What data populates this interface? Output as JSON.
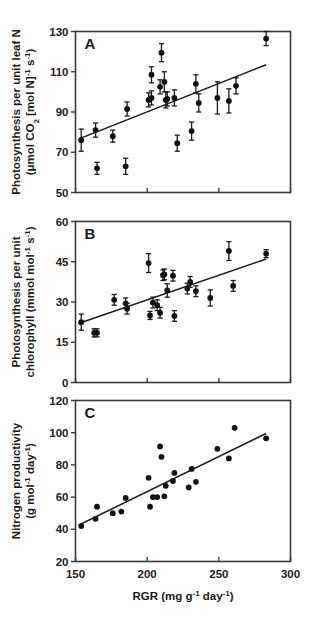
{
  "figure": {
    "xaxis": {
      "label_main": "RGR (mg g",
      "label_sup1": "-1",
      "label_mid": " day",
      "label_sup2": "-1",
      "label_end": ")",
      "min": 150,
      "max": 300,
      "ticks": [
        150,
        200,
        250,
        300
      ]
    }
  },
  "chart_data": [
    {
      "type": "scatter",
      "panel": "A",
      "title": "Photosynthesis per unit leaf N vs RGR",
      "xlabel": "RGR (mg g-1 day-1)",
      "ylabel": "Photosynthesis per unit leaf N (umol CO2 [mol N]-1 s-1)",
      "ylabel_line1_a": "Photosynthesis per unit leaf N",
      "ylabel_line2_a": "(μmol CO",
      "ylabel_line2_sub": "2",
      "ylabel_line2_b": " [mol N]",
      "ylabel_line2_sup1": "-1",
      "ylabel_line2_c": " s",
      "ylabel_line2_sup2": "-1",
      "ylabel_line2_d": ")",
      "xlim": [
        150,
        300
      ],
      "ylim": [
        50,
        130
      ],
      "yticks": [
        50,
        70,
        90,
        110,
        130
      ],
      "grid": false,
      "legend": "none",
      "errorbars": true,
      "points": [
        {
          "x": 154,
          "y": 76,
          "err": 5.5
        },
        {
          "x": 164,
          "y": 81,
          "err": 3.5
        },
        {
          "x": 165,
          "y": 62,
          "err": 3.0
        },
        {
          "x": 176,
          "y": 78,
          "err": 3.0
        },
        {
          "x": 185,
          "y": 63,
          "err": 4.0
        },
        {
          "x": 186,
          "y": 91.5,
          "err": 3.5
        },
        {
          "x": 201,
          "y": 96,
          "err": 3.5
        },
        {
          "x": 203,
          "y": 97,
          "err": 3.5
        },
        {
          "x": 203,
          "y": 108.5,
          "err": 4.0
        },
        {
          "x": 209,
          "y": 102.5,
          "err": 3.5
        },
        {
          "x": 210,
          "y": 119.5,
          "err": 4.5
        },
        {
          "x": 212,
          "y": 105,
          "err": 5.0
        },
        {
          "x": 213,
          "y": 96,
          "err": 4.0
        },
        {
          "x": 214,
          "y": 96.5,
          "err": 3.5
        },
        {
          "x": 219,
          "y": 97,
          "err": 4.0
        },
        {
          "x": 221,
          "y": 74.5,
          "err": 4.0
        },
        {
          "x": 231,
          "y": 80.5,
          "err": 4.5
        },
        {
          "x": 234,
          "y": 104,
          "err": 4.5
        },
        {
          "x": 236,
          "y": 94.5,
          "err": 4.5
        },
        {
          "x": 249,
          "y": 97,
          "err": 8.0
        },
        {
          "x": 257,
          "y": 95.5,
          "err": 6.0
        },
        {
          "x": 262,
          "y": 103,
          "err": 4.0
        },
        {
          "x": 283,
          "y": 126.5,
          "err": 3.5
        }
      ],
      "fit_line": {
        "x1": 152,
        "y1": 76.5,
        "x2": 283,
        "y2": 113.5
      }
    },
    {
      "type": "scatter",
      "panel": "B",
      "title": "Photosynthesis per unit chlorophyll vs RGR",
      "xlabel": "RGR (mg g-1 day-1)",
      "ylabel": "Photosynthesis per unit chlorophyll (mmol mol-1 s-1)",
      "ylabel_line1_b": "Photosynthesis per unit",
      "ylabel_line2_b": "chlorophyll (mmol mol",
      "ylabel_line2_sup1": "-1",
      "ylabel_line2_mid": " s",
      "ylabel_line2_sup2": "-1",
      "ylabel_line2_end": ")",
      "xlim": [
        150,
        300
      ],
      "ylim": [
        0,
        60
      ],
      "yticks": [
        0,
        15,
        30,
        45,
        60
      ],
      "grid": false,
      "legend": "none",
      "errorbars": true,
      "points": [
        {
          "x": 154,
          "y": 22.5,
          "err": 3.0
        },
        {
          "x": 163,
          "y": 18.5,
          "err": 1.5
        },
        {
          "x": 165,
          "y": 18.5,
          "err": 1.5
        },
        {
          "x": 177,
          "y": 30.8,
          "err": 2.0
        },
        {
          "x": 185,
          "y": 29.5,
          "err": 2.0
        },
        {
          "x": 186,
          "y": 27.5,
          "err": 2.0
        },
        {
          "x": 201,
          "y": 44.5,
          "err": 3.5
        },
        {
          "x": 202,
          "y": 25.0,
          "err": 1.5
        },
        {
          "x": 204,
          "y": 29.8,
          "err": 2.0
        },
        {
          "x": 207,
          "y": 28.8,
          "err": 2.0
        },
        {
          "x": 209,
          "y": 26.0,
          "err": 2.0
        },
        {
          "x": 211,
          "y": 40.0,
          "err": 2.0
        },
        {
          "x": 212,
          "y": 40.3,
          "err": 2.0
        },
        {
          "x": 214,
          "y": 34.3,
          "err": 2.5
        },
        {
          "x": 218,
          "y": 39.8,
          "err": 2.0
        },
        {
          "x": 219,
          "y": 24.8,
          "err": 2.0
        },
        {
          "x": 228,
          "y": 35.0,
          "err": 2.0
        },
        {
          "x": 230,
          "y": 37.5,
          "err": 2.0
        },
        {
          "x": 234,
          "y": 34.0,
          "err": 2.0
        },
        {
          "x": 244,
          "y": 31.5,
          "err": 3.0
        },
        {
          "x": 257,
          "y": 49.0,
          "err": 3.5
        },
        {
          "x": 260,
          "y": 36.0,
          "err": 2.0
        },
        {
          "x": 283,
          "y": 48.0,
          "err": 1.5
        }
      ],
      "fit_line": {
        "x1": 152,
        "y1": 22.0,
        "x2": 283,
        "y2": 46.0
      }
    },
    {
      "type": "scatter",
      "panel": "C",
      "title": "Nitrogen productivity vs RGR",
      "xlabel": "RGR (mg g-1 day-1)",
      "ylabel": "Nitrogen productivity (g mol-1 day-1)",
      "ylabel_line1_c": "Nitrogen productivity",
      "ylabel_line2_c": "(g mol",
      "ylabel_line2_sup1": "-1",
      "ylabel_line2_mid": " day",
      "ylabel_line2_sup2": "-1",
      "ylabel_line2_end": ")",
      "xlim": [
        150,
        300
      ],
      "ylim": [
        20,
        120
      ],
      "yticks": [
        20,
        40,
        60,
        80,
        100,
        120
      ],
      "grid": false,
      "legend": "none",
      "errorbars": false,
      "points": [
        {
          "x": 154,
          "y": 42
        },
        {
          "x": 164,
          "y": 46.5
        },
        {
          "x": 165,
          "y": 54
        },
        {
          "x": 176,
          "y": 50
        },
        {
          "x": 182,
          "y": 51
        },
        {
          "x": 185,
          "y": 59.5
        },
        {
          "x": 201,
          "y": 72
        },
        {
          "x": 202,
          "y": 54
        },
        {
          "x": 204,
          "y": 60
        },
        {
          "x": 207,
          "y": 60
        },
        {
          "x": 209,
          "y": 91.5
        },
        {
          "x": 210,
          "y": 85
        },
        {
          "x": 212,
          "y": 60.5
        },
        {
          "x": 213,
          "y": 67
        },
        {
          "x": 218,
          "y": 70
        },
        {
          "x": 219,
          "y": 75
        },
        {
          "x": 229,
          "y": 66
        },
        {
          "x": 231,
          "y": 77.5
        },
        {
          "x": 234,
          "y": 69.5
        },
        {
          "x": 249,
          "y": 90
        },
        {
          "x": 257,
          "y": 84
        },
        {
          "x": 261,
          "y": 103
        },
        {
          "x": 283,
          "y": 96.5
        }
      ],
      "fit_line": {
        "x1": 152,
        "y1": 42.5,
        "x2": 283,
        "y2": 99.5
      }
    }
  ]
}
